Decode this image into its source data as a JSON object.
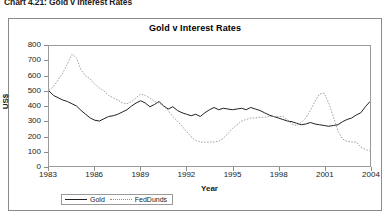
{
  "figure": {
    "caption": "Chart 4.21: Gold v Interest Rates"
  },
  "colors": {
    "gold_line": "#222222",
    "fedfunds_line": "#8d8d8d",
    "frame": "#8a8a8a",
    "background": "#ffffff",
    "text": "#1a1a1a"
  },
  "legend": {
    "position": "bottom-left",
    "entries": [
      {
        "label": "Gold",
        "style": "solid",
        "icon": "solid-line-swatch"
      },
      {
        "label": "FedDunds",
        "style": "dotted",
        "icon": "dotted-line-swatch"
      }
    ]
  },
  "chart_data": {
    "type": "line",
    "title": "Gold v Interest Rates",
    "xlabel": "Year",
    "ylabel": "US$",
    "xlim": [
      1983,
      2004
    ],
    "ylim": [
      0,
      800
    ],
    "ytick_values": [
      0,
      100,
      200,
      300,
      400,
      500,
      600,
      700,
      800
    ],
    "ytick_labels": [
      "0",
      "100",
      "200",
      "300",
      "400",
      "500",
      "600",
      "700",
      "800"
    ],
    "xtick_values": [
      1983,
      1986,
      1989,
      1992,
      1995,
      1998,
      2001,
      2004
    ],
    "xtick_labels": [
      "1983",
      "1986",
      "1989",
      "1992",
      "1995",
      "1998",
      "2001",
      "2004"
    ],
    "grid": false,
    "legend_position": "below-axes-left",
    "series": [
      {
        "name": "Gold",
        "style": "solid",
        "color": "#222222",
        "x": [
          1983.0,
          1983.3,
          1983.6,
          1983.9,
          1984.2,
          1984.5,
          1984.8,
          1985.1,
          1985.4,
          1985.7,
          1986.0,
          1986.3,
          1986.6,
          1986.9,
          1987.2,
          1987.5,
          1987.8,
          1988.1,
          1988.4,
          1988.7,
          1989.0,
          1989.3,
          1989.6,
          1989.9,
          1990.2,
          1990.5,
          1990.8,
          1991.1,
          1991.4,
          1991.7,
          1992.0,
          1992.3,
          1992.6,
          1992.9,
          1993.2,
          1993.5,
          1993.8,
          1994.1,
          1994.4,
          1994.7,
          1995.0,
          1995.3,
          1995.6,
          1995.9,
          1996.2,
          1996.5,
          1996.8,
          1997.1,
          1997.4,
          1997.7,
          1998.0,
          1998.3,
          1998.6,
          1998.9,
          1999.2,
          1999.5,
          1999.8,
          2000.1,
          2000.4,
          2000.7,
          2001.0,
          2001.3,
          2001.6,
          2001.9,
          2002.2,
          2002.5,
          2002.8,
          2003.1,
          2003.4,
          2003.7,
          2004.0
        ],
        "y": [
          500,
          470,
          455,
          440,
          430,
          415,
          400,
          370,
          345,
          320,
          305,
          300,
          315,
          330,
          335,
          345,
          360,
          375,
          400,
          420,
          435,
          420,
          395,
          410,
          430,
          400,
          380,
          395,
          370,
          355,
          345,
          335,
          345,
          330,
          355,
          375,
          390,
          375,
          385,
          380,
          375,
          380,
          385,
          375,
          390,
          380,
          370,
          355,
          340,
          330,
          320,
          310,
          300,
          295,
          285,
          275,
          280,
          290,
          280,
          275,
          270,
          265,
          270,
          275,
          295,
          310,
          320,
          340,
          355,
          395,
          430
        ]
      },
      {
        "name": "FedDunds",
        "style": "dotted",
        "color": "#8d8d8d",
        "x": [
          1983.0,
          1983.3,
          1983.6,
          1983.9,
          1984.2,
          1984.5,
          1984.8,
          1985.1,
          1985.4,
          1985.7,
          1986.0,
          1986.3,
          1986.6,
          1986.9,
          1987.2,
          1987.5,
          1987.8,
          1988.1,
          1988.4,
          1988.7,
          1989.0,
          1989.3,
          1989.6,
          1989.9,
          1990.2,
          1990.5,
          1990.8,
          1991.1,
          1991.4,
          1991.7,
          1992.0,
          1992.3,
          1992.6,
          1992.9,
          1993.2,
          1993.5,
          1993.8,
          1994.1,
          1994.4,
          1994.7,
          1995.0,
          1995.3,
          1995.6,
          1995.9,
          1996.2,
          1996.5,
          1996.8,
          1997.1,
          1997.4,
          1997.7,
          1998.0,
          1998.3,
          1998.6,
          1998.9,
          1999.2,
          1999.5,
          1999.8,
          2000.1,
          2000.4,
          2000.7,
          2001.0,
          2001.3,
          2001.6,
          2001.9,
          2002.2,
          2002.5,
          2002.8,
          2003.1,
          2003.4,
          2003.7,
          2004.0
        ],
        "y": [
          505,
          530,
          575,
          620,
          680,
          745,
          720,
          640,
          600,
          580,
          545,
          520,
          500,
          470,
          455,
          440,
          420,
          415,
          430,
          455,
          480,
          470,
          455,
          430,
          420,
          400,
          370,
          330,
          300,
          265,
          230,
          195,
          170,
          160,
          158,
          160,
          160,
          165,
          185,
          215,
          250,
          275,
          300,
          310,
          320,
          320,
          325,
          325,
          330,
          330,
          330,
          330,
          310,
          280,
          270,
          290,
          320,
          370,
          430,
          480,
          485,
          420,
          330,
          235,
          180,
          165,
          160,
          160,
          125,
          110,
          100
        ]
      }
    ]
  }
}
